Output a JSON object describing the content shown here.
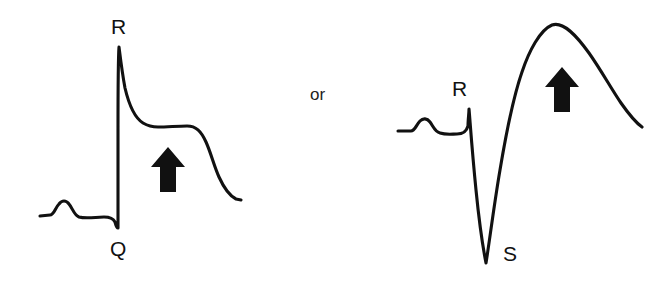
{
  "figure": {
    "background_color": "#ffffff",
    "stroke_color": "#111111",
    "connector": {
      "label": "or",
      "x": 310,
      "y": 86
    },
    "panels": [
      {
        "id": "left-panel",
        "name": "st-elevation-with-q-wave",
        "labels": [
          {
            "id": "r-label-left",
            "text": "R",
            "x": 111,
            "y": 16
          },
          {
            "id": "q-label-left",
            "text": "Q",
            "x": 110,
            "y": 238
          }
        ],
        "arrow": {
          "id": "elevation-arrow-left",
          "direction": "up",
          "x": 151,
          "y": 147,
          "width": 34,
          "height": 45,
          "color": "#111111"
        },
        "waveform": {
          "type": "ecg-tracing",
          "baseline_y": 215,
          "start_x": 40,
          "end_x": 241,
          "features": [
            {
              "name": "baseline-start",
              "x": 40,
              "y": 215
            },
            {
              "name": "p-wave-peak",
              "x": 63,
              "y": 202
            },
            {
              "name": "pr-segment",
              "x": 100,
              "y": 216
            },
            {
              "name": "q-wave-nadir",
              "x": 117,
              "y": 228
            },
            {
              "name": "r-wave-peak",
              "x": 119,
              "y": 47
            },
            {
              "name": "st-plateau-start",
              "x": 152,
              "y": 126
            },
            {
              "name": "st-plateau-end",
              "x": 188,
              "y": 125
            },
            {
              "name": "t-wave-downslope",
              "x": 214,
              "y": 172
            },
            {
              "name": "tail-end",
              "x": 241,
              "y": 200
            }
          ]
        }
      },
      {
        "id": "right-panel",
        "name": "st-elevation-with-s-wave",
        "labels": [
          {
            "id": "r-label-right",
            "text": "R",
            "x": 452,
            "y": 78
          },
          {
            "id": "s-label-right",
            "text": "S",
            "x": 503,
            "y": 243
          }
        ],
        "arrow": {
          "id": "elevation-arrow-right",
          "direction": "up",
          "x": 545,
          "y": 67,
          "width": 34,
          "height": 45,
          "color": "#111111"
        },
        "waveform": {
          "type": "ecg-tracing",
          "baseline_y": 131,
          "start_x": 398,
          "end_x": 642,
          "features": [
            {
              "name": "baseline-start",
              "x": 398,
              "y": 131
            },
            {
              "name": "p-wave-peak",
              "x": 425,
              "y": 120
            },
            {
              "name": "pr-segment",
              "x": 455,
              "y": 133
            },
            {
              "name": "r-wave-peak",
              "x": 469,
              "y": 109
            },
            {
              "name": "s-wave-nadir",
              "x": 486,
              "y": 263
            },
            {
              "name": "t-wave-upslope",
              "x": 515,
              "y": 60
            },
            {
              "name": "t-wave-apex",
              "x": 552,
              "y": 24
            },
            {
              "name": "t-wave-downslope",
              "x": 615,
              "y": 88
            },
            {
              "name": "tail-end",
              "x": 642,
              "y": 127
            }
          ]
        }
      }
    ]
  }
}
